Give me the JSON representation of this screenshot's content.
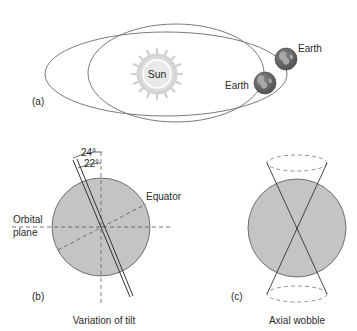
{
  "panel_a": {
    "label": "(a)",
    "sun_label": "Sun",
    "earth_label_1": "Earth",
    "earth_label_2": "Earth"
  },
  "panel_b": {
    "label": "(b)",
    "angle_outer": "24°",
    "angle_inner": "22°",
    "equator_label": "Equator",
    "orbital_label_line1": "Orbital",
    "orbital_label_line2": "plane",
    "caption": "Variation of tilt"
  },
  "panel_c": {
    "label": "(c)",
    "caption": "Axial wobble"
  },
  "colors": {
    "globe_fill": "#c4c4c4",
    "line": "#555555",
    "sun_fill": "#e6e6e6",
    "earth_fill": "#6d6d6d",
    "earth_land": "#a8a8a8"
  }
}
